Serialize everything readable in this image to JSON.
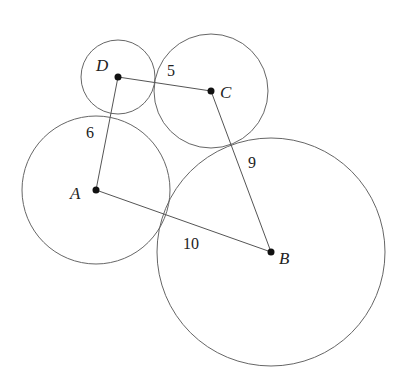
{
  "diagram": {
    "points": [
      {
        "name": "A",
        "x": 96,
        "y": 190,
        "label": "A"
      },
      {
        "name": "B",
        "x": 271,
        "y": 252,
        "label": "B"
      },
      {
        "name": "C",
        "x": 211,
        "y": 91,
        "label": "C"
      },
      {
        "name": "D",
        "x": 118,
        "y": 77,
        "label": "D"
      }
    ],
    "circles": [
      {
        "center": "A",
        "r": 74
      },
      {
        "center": "B",
        "r": 114
      },
      {
        "center": "C",
        "r": 57
      },
      {
        "center": "D",
        "r": 37
      }
    ],
    "segments": [
      {
        "from": "D",
        "to": "C",
        "label": "5"
      },
      {
        "from": "D",
        "to": "A",
        "label": "6"
      },
      {
        "from": "C",
        "to": "B",
        "label": "9"
      },
      {
        "from": "A",
        "to": "B",
        "label": "10"
      }
    ],
    "colors": {
      "stroke": "#555555",
      "point": "#111111",
      "text": "#222222"
    }
  }
}
